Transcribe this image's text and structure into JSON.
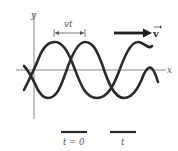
{
  "diagram": {
    "axes": {
      "x_label": "x",
      "y_label": "y"
    },
    "displacement_label": "vt",
    "velocity_label": "v",
    "legend": [
      {
        "label": "t = 0",
        "color": "#2a2a2a"
      },
      {
        "label": "t",
        "color": "#2a2a2a"
      }
    ],
    "colors": {
      "wave": "#2a2a2a",
      "axis": "#888888",
      "text": "#555555"
    }
  }
}
